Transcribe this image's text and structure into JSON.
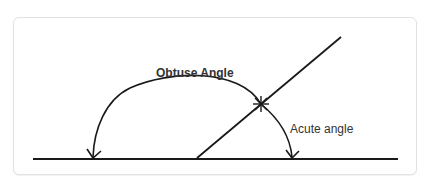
{
  "diagram": {
    "labels": {
      "obtuse": "Obtuse Angle",
      "acute": "Acute angle"
    },
    "colors": {
      "stroke": "#1a1a1a",
      "text": "#333333",
      "border": "#e2e2e2",
      "background": "#ffffff"
    },
    "geometry": {
      "baseline": {
        "x1": 33,
        "y1": 159,
        "x2": 398,
        "y2": 159
      },
      "ray": {
        "x1": 197,
        "y1": 158,
        "x2": 341,
        "y2": 37
      },
      "intersection_marker": {
        "x": 261,
        "y": 104
      },
      "obtuse_arc_end": {
        "x": 93,
        "y": 158
      },
      "acute_arc_end": {
        "x": 292,
        "y": 158
      }
    }
  }
}
